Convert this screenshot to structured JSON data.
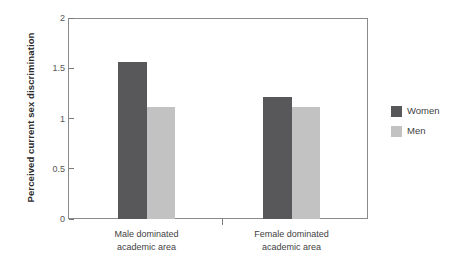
{
  "chart_data": {
    "type": "bar",
    "title": "",
    "xlabel": "",
    "ylabel": "Perceived current sex discrimination",
    "ylim": [
      0,
      2
    ],
    "yticks": [
      "0",
      "0.5",
      "1",
      "1.5",
      "2"
    ],
    "ytick_values": [
      0,
      0.5,
      1,
      1.5,
      2
    ],
    "grid": false,
    "legend_position": "right",
    "categories": [
      "Male dominated academic area",
      "Female dominated academic area"
    ],
    "category_lines": [
      [
        "Male dominated",
        "academic area"
      ],
      [
        "Female dominated",
        "academic area"
      ]
    ],
    "series": [
      {
        "name": "Women",
        "color": "#58585a",
        "values": [
          1.56,
          1.21
        ]
      },
      {
        "name": "Men",
        "color": "#c2c2c2",
        "values": [
          1.11,
          1.11
        ]
      }
    ]
  },
  "legend": {
    "items": [
      {
        "label": "Women",
        "swatch": "#58585a"
      },
      {
        "label": "Men",
        "swatch": "#c2c2c2"
      }
    ]
  },
  "axis": {
    "y_title": "Perceived current sex discrimination"
  }
}
